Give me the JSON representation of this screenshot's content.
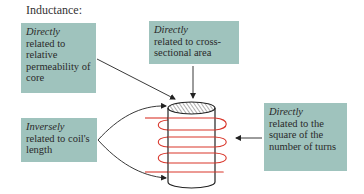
{
  "title": "Inductance:",
  "colors": {
    "box_fill": "#9fc3bd",
    "coil": "#d9362b",
    "lines": "#222222"
  },
  "boxes": [
    {
      "id": "permeability",
      "emphasis": "Directly",
      "text": "related to relative permeability of core"
    },
    {
      "id": "cross-section",
      "emphasis": "Directly",
      "text": "related to cross-sectional area"
    },
    {
      "id": "length",
      "emphasis": "Inversely",
      "text": "related to coil's length"
    },
    {
      "id": "turns",
      "emphasis": "Directly",
      "text": "related to the square of the number of turns"
    }
  ],
  "figure": {
    "object": "cylindrical core with coil winding",
    "core_top": "hatched cross-section",
    "coil_turns_visible": 4
  }
}
